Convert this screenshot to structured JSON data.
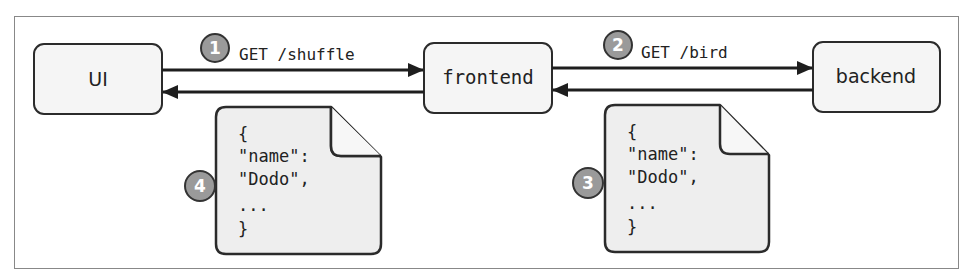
{
  "colors": {
    "frame_border": "#888888",
    "box_fill": "#f5f5f5",
    "box_stroke": "#2b2b2b",
    "arrow": "#1e1e1e",
    "badge_fill": "#9a9a9a",
    "badge_stroke": "#333333",
    "doc_fill": "#eeeeee"
  },
  "nodes": [
    {
      "id": "ui",
      "label": "UI"
    },
    {
      "id": "frontend",
      "label": "frontend"
    },
    {
      "id": "backend",
      "label": "backend"
    }
  ],
  "edges": [
    {
      "step": "1",
      "label": "GET /shuffle",
      "from": "ui",
      "to": "frontend"
    },
    {
      "step": "2",
      "label": "GET /bird",
      "from": "frontend",
      "to": "backend"
    }
  ],
  "responses": [
    {
      "step": "4",
      "lines": [
        "{",
        "\"name\":",
        "\"Dodo\",",
        "...",
        "}"
      ],
      "from": "frontend",
      "to": "ui"
    },
    {
      "step": "3",
      "lines": [
        "{",
        "\"name\":",
        "\"Dodo\",",
        "...",
        "}"
      ],
      "from": "backend",
      "to": "frontend"
    }
  ]
}
